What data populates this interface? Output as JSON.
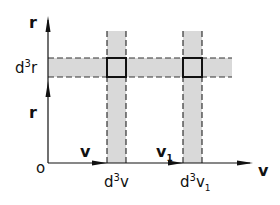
{
  "diagram": {
    "axes": {
      "vertical_label_top": "r",
      "vertical_label_mid": "r",
      "horizontal_label_end": "v",
      "origin_label": "o"
    },
    "vectors": {
      "v": "v",
      "v1_base": "v",
      "v1_sub": "1"
    },
    "volume_elements": {
      "r_elem_prefix": "d",
      "r_elem_exp": "3",
      "r_elem_var": "r",
      "v_elem_prefix": "d",
      "v_elem_exp": "3",
      "v_elem_var": "v",
      "v1_elem_prefix": "d",
      "v1_elem_exp": "3",
      "v1_elem_var": "v",
      "v1_elem_sub": "1"
    },
    "colors": {
      "band_fill": "#d9d9d9",
      "line": "#111111",
      "dash": "#333333"
    }
  }
}
